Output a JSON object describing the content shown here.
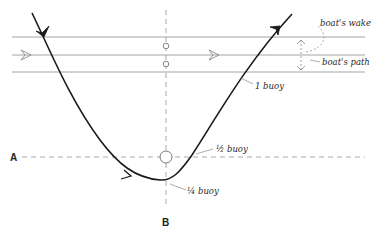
{
  "diagram": {
    "labels": {
      "boats_wake": "boat's wake",
      "boats_path": "boat's path",
      "one_buoy": "1 buoy",
      "half_buoy": "½ buoy",
      "quarter_buoy": "¼ buoy",
      "point_a": "A",
      "point_b": "B"
    },
    "colors": {
      "curve": "#1a1a1a",
      "wake_lines": "#9a9a9a",
      "dashed_lines": "#a0a0a0",
      "text": "#2a2a2a"
    }
  }
}
